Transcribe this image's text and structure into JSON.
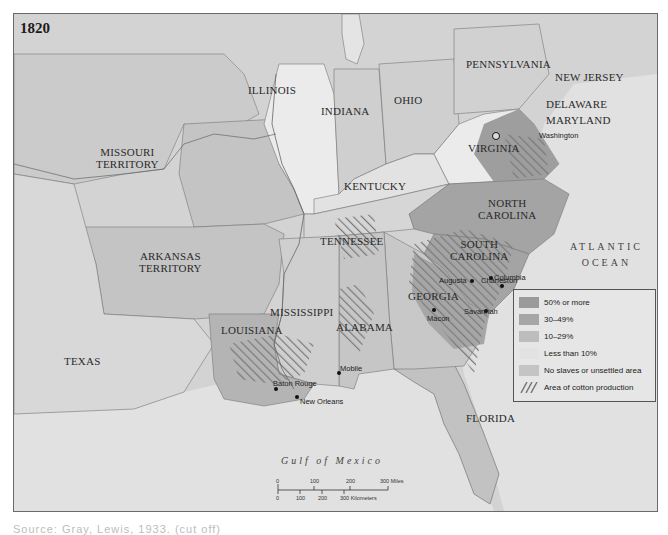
{
  "map": {
    "year": "1820",
    "colors": {
      "background": "#dcdcdc",
      "water": "#e4e4e4",
      "pct_50_plus": "#9a9a9a",
      "pct_30_49": "#a8a8a8",
      "pct_10_29": "#bdbdbd",
      "less_than_10": "#e9e9e9",
      "no_slaves": "#c6c6c6",
      "cotton_hatch": "#7c7c7c",
      "border": "#6a6a6a"
    },
    "states": [
      {
        "name": "MISSOURI\nTERRITORY",
        "line1": "MISSOURI",
        "line2": "TERRITORY"
      },
      {
        "name": "ILLINOIS"
      },
      {
        "name": "INDIANA"
      },
      {
        "name": "OHIO"
      },
      {
        "name": "PENNSYLVANIA"
      },
      {
        "name": "NEW JERSEY"
      },
      {
        "name": "DELAWARE"
      },
      {
        "name": "MARYLAND"
      },
      {
        "name": "VIRGINIA"
      },
      {
        "name": "KENTUCKY"
      },
      {
        "name": "NORTH CAROLINA",
        "line1": "NORTH",
        "line2": "CAROLINA"
      },
      {
        "name": "TENNESSEE"
      },
      {
        "name": "SOUTH CAROLINA",
        "line1": "SOUTH",
        "line2": "CAROLINA"
      },
      {
        "name": "ARKANSAS TERRITORY",
        "line1": "ARKANSAS",
        "line2": "TERRITORY"
      },
      {
        "name": "GEORGIA"
      },
      {
        "name": "MISSISSIPPI"
      },
      {
        "name": "ALABAMA"
      },
      {
        "name": "LOUISIANA"
      },
      {
        "name": "TEXAS"
      },
      {
        "name": "FLORIDA"
      }
    ],
    "cities": [
      {
        "name": "Washington"
      },
      {
        "name": "Columbia"
      },
      {
        "name": "Augusta"
      },
      {
        "name": "Charleston"
      },
      {
        "name": "Macon"
      },
      {
        "name": "Savannah"
      },
      {
        "name": "Mobile"
      },
      {
        "name": "Baton Rouge"
      },
      {
        "name": "New Orleans"
      }
    ],
    "water_bodies": {
      "gulf": "Gulf of Mexico",
      "ocean_line1": "ATLANTIC",
      "ocean_line2": "OCEAN"
    },
    "legend": {
      "items": [
        {
          "label": "50% or more"
        },
        {
          "label": "30–49%"
        },
        {
          "label": "10–29%"
        },
        {
          "label": "Less than 10%"
        },
        {
          "label": "No slaves or unsettled area"
        },
        {
          "label": "Area of cotton production"
        }
      ]
    },
    "scale": {
      "miles": [
        "0",
        "100",
        "200",
        "300 Miles"
      ],
      "km": [
        "0",
        "100",
        "200",
        "300 Kilometers"
      ]
    }
  },
  "caption": "Source: Gray, Lewis, 1933. (cut off)"
}
